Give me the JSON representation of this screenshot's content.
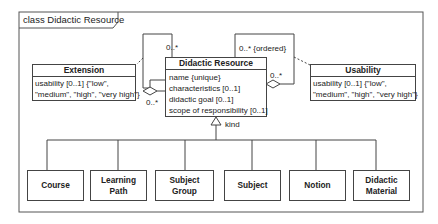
{
  "frame": {
    "title": "class Didactic Resource"
  },
  "classes": {
    "didactic_resource": {
      "name": "Didactic Resource",
      "attributes": [
        "name {unique}",
        "characteristics [0..1]",
        "didactic goal [0..1]",
        "scope of responsibility [0..1]"
      ]
    },
    "extension": {
      "name": "Extension",
      "attributes": [
        "usability [0..1] {\"low\",",
        "\"medium\", \"high\", \"very high\"}"
      ]
    },
    "usability": {
      "name": "Usability",
      "attributes": [
        "usability [0..1] {\"low\",",
        "\"medium\", \"high\", \"very high\"}"
      ]
    }
  },
  "associations": {
    "left_top_multiplicity": "0..*",
    "left_bottom_multiplicity": "0..*",
    "right_top_multiplicity": "0..* {ordered}",
    "right_bottom_multiplicity": "0..*"
  },
  "generalization": {
    "label": "kind"
  },
  "subclasses": [
    {
      "line1": "Course",
      "line2": ""
    },
    {
      "line1": "Learning",
      "line2": "Path"
    },
    {
      "line1": "Subject Group",
      "line2": ""
    },
    {
      "line1": "Subject",
      "line2": ""
    },
    {
      "line1": "Notion",
      "line2": ""
    },
    {
      "line1": "Didactic",
      "line2": "Material"
    }
  ],
  "colors": {
    "line": "#444444",
    "background": "#ffffff"
  }
}
